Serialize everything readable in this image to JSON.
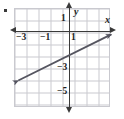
{
  "figure": {
    "bullet_marker": "•",
    "background": "#ffffff",
    "grid_color": "#c9c9cf",
    "axis_color": "#3a3a3a",
    "line_color": "#555560"
  },
  "axes": {
    "x_name": "x",
    "y_name": "y",
    "x_ticks": [
      {
        "label": "−3",
        "value": -3
      },
      {
        "label": "−1",
        "value": -1
      },
      {
        "label": "1",
        "value": 1
      }
    ],
    "y_ticks": [
      {
        "label": "1",
        "value": 1
      },
      {
        "label": "−3",
        "value": -3
      },
      {
        "label": "−5",
        "value": -5
      }
    ],
    "xlim": [
      -4.5,
      3.5
    ],
    "ylim": [
      -6.5,
      1.75
    ],
    "grid": true
  },
  "chart_data": {
    "type": "line",
    "title": "",
    "xlabel": "x",
    "ylabel": "y",
    "xlim": [
      -4.5,
      3.5
    ],
    "ylim": [
      -6.5,
      1.75
    ],
    "grid": true,
    "legend": "none",
    "x_tick_labels": [
      "−3",
      "−1",
      "1"
    ],
    "x_tick_values": [
      -3,
      -1,
      1
    ],
    "y_tick_labels": [
      "1",
      "−3",
      "−5"
    ],
    "y_tick_values": [
      1,
      -3,
      -5
    ],
    "series": [
      {
        "name": "line",
        "kind": "straight-line",
        "slope": 0.5,
        "intercept": -2,
        "equation": "y = 0.5x − 2",
        "arrows": "both",
        "color": "#555560",
        "endpoints": [
          {
            "x": -4.25,
            "y": -4.1
          },
          {
            "x": 3.5,
            "y": -0.25
          }
        ],
        "points": [
          {
            "x": -4,
            "y": -4
          },
          {
            "x": -2,
            "y": -3
          },
          {
            "x": 0,
            "y": -2
          },
          {
            "x": 2,
            "y": -1
          }
        ]
      }
    ]
  }
}
